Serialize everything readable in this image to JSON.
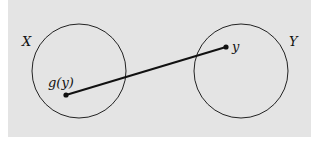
{
  "diagram": {
    "sets": [
      {
        "label": "X",
        "cx": 79,
        "cy": 71,
        "r": 47,
        "label_x": 22,
        "label_y": 46
      },
      {
        "label": "Y",
        "cx": 241,
        "cy": 71,
        "r": 47,
        "label_x": 289,
        "label_y": 46
      }
    ],
    "points": [
      {
        "label": "g(y)",
        "x": 66,
        "y": 95,
        "label_x": 48,
        "label_y": 87
      },
      {
        "label": "y",
        "x": 226,
        "y": 47,
        "label_x": 232,
        "label_y": 51
      }
    ],
    "arrow": {
      "from": "y",
      "to": "g(y)"
    },
    "colors": {
      "background": "#e4e4e4",
      "stroke": "#111111"
    }
  }
}
